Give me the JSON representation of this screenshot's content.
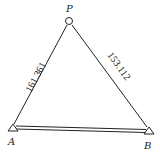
{
  "diagram": {
    "type": "survey-triangle",
    "points": {
      "P": {
        "label": "P",
        "marker": "circle",
        "x": 69,
        "y": 21
      },
      "A": {
        "label": "A",
        "marker": "triangle",
        "x": 13,
        "y": 128
      },
      "B": {
        "label": "B",
        "marker": "triangle",
        "x": 148,
        "y": 131
      }
    },
    "edges": [
      {
        "from": "P",
        "to": "A",
        "label": "161.361",
        "style": "single"
      },
      {
        "from": "P",
        "to": "B",
        "label": "153.112",
        "style": "single"
      },
      {
        "from": "A",
        "to": "B",
        "label": "",
        "style": "double"
      }
    ],
    "colors": {
      "line": "#222222",
      "background": "#ffffff"
    }
  }
}
